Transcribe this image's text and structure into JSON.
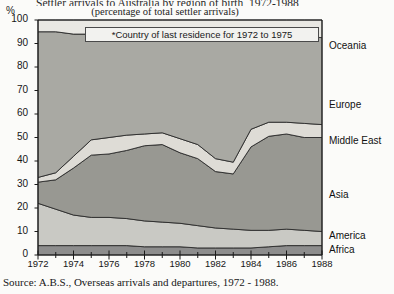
{
  "header": {
    "title": "Settler arrivals to Australia by region of birth, 1972-1988",
    "subtitle": "(percentage of total settler arrivals)",
    "percent_symbol": "%"
  },
  "callout": {
    "text": "*Country of last residence for 1972 to 1975"
  },
  "source": {
    "text": "Source: A.B.S., Overseas arrivals and departures, 1972 - 1988."
  },
  "colors": {
    "africa": "#8d8d8d",
    "america": "#c9c9c4",
    "asia": "#989892",
    "middle_east": "#dedcd6",
    "europe": "#a9a9a3",
    "oceania": "#e9e8e3",
    "axis": "#1a1a1a",
    "background": "#fbfbf9"
  },
  "chart_data": {
    "type": "area",
    "title": "Settler arrivals to Australia by region of birth, 1972-1988",
    "subtitle": "(percentage of total settler arrivals)",
    "xlabel": "",
    "ylabel": "%",
    "stacked": true,
    "normalized_percent": true,
    "grid": false,
    "legend_position": "right-inline",
    "xlim": [
      1972,
      1988
    ],
    "ylim": [
      0,
      100
    ],
    "ytick_values": [
      0,
      10,
      20,
      30,
      40,
      50,
      60,
      70,
      80,
      90,
      100
    ],
    "ytick_labels": [
      "0",
      "10",
      "20",
      "30",
      "40",
      "50",
      "60",
      "70",
      "80",
      "90",
      "100"
    ],
    "xtick_labels": [
      "1972",
      "1974",
      "1976",
      "1978",
      "1980",
      "1982",
      "1984",
      "1986",
      "1988"
    ],
    "xtick_minor": [
      1973,
      1975,
      1977,
      1979,
      1981,
      1983,
      1985,
      1987
    ],
    "x": [
      1972,
      1973,
      1974,
      1975,
      1976,
      1977,
      1978,
      1979,
      1980,
      1981,
      1982,
      1983,
      1984,
      1985,
      1986,
      1987,
      1988
    ],
    "series": [
      {
        "name": "Africa",
        "color": "#8d8d8d",
        "values": [
          4,
          4,
          4,
          4,
          4,
          4,
          3.5,
          3.5,
          3.5,
          3,
          3,
          3,
          3,
          3.5,
          4,
          4,
          4
        ]
      },
      {
        "name": "America",
        "color": "#c9c9c4",
        "values": [
          18,
          15.5,
          13,
          12,
          12,
          11.5,
          11,
          10.5,
          10,
          9.5,
          8.5,
          8,
          7.5,
          7,
          7,
          6.5,
          6
        ]
      },
      {
        "name": "Asia",
        "color": "#989892",
        "values": [
          9,
          12.5,
          20,
          26.5,
          27,
          29,
          32,
          33,
          30,
          28.5,
          24,
          23.5,
          35.5,
          40,
          40.5,
          39.5,
          40
        ]
      },
      {
        "name": "Middle East",
        "color": "#dedcd6",
        "values": [
          2,
          3,
          5,
          6.5,
          7,
          6.5,
          5,
          5,
          6,
          6,
          5.5,
          5,
          7.5,
          6,
          5,
          6,
          5.5
        ]
      },
      {
        "name": "Europe",
        "color": "#a9a9a3",
        "values": [
          62,
          60,
          52,
          45,
          44,
          43.5,
          42.5,
          42,
          45,
          48,
          54,
          55.5,
          41,
          37,
          37,
          37,
          37
        ]
      },
      {
        "name": "Oceania",
        "color": "#e9e8e3",
        "values": [
          5,
          5,
          6,
          6,
          6,
          5.5,
          6,
          6,
          5.5,
          5,
          5,
          5,
          5.5,
          6.5,
          6.5,
          7,
          7.5
        ]
      }
    ],
    "series_labels": [
      {
        "name": "Oceania",
        "y_px": 46
      },
      {
        "name": "Europe",
        "y_px": 105
      },
      {
        "name": "Middle East",
        "y_px": 141
      },
      {
        "name": "Asia",
        "y_px": 195
      },
      {
        "name": "America",
        "y_px": 236
      },
      {
        "name": "Africa",
        "y_px": 250
      }
    ]
  }
}
